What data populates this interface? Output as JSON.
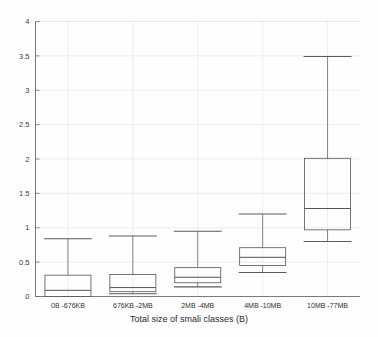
{
  "chart_data": {
    "type": "box",
    "title": "",
    "xlabel": "Total size of smali classes (B)",
    "ylabel": "",
    "categories": [
      "0B -676KB",
      "676KB -2MB",
      "2MB -4MB",
      "4MB -10MB",
      "10MB -77MB"
    ],
    "ylim": [
      0,
      4
    ],
    "ytick_labels": [
      "0",
      "0.5",
      "1",
      "1.5",
      "2",
      "2.5",
      "3",
      "3.5",
      "4"
    ],
    "ytick_values": [
      0,
      0.5,
      1,
      1.5,
      2,
      2.5,
      3,
      3.5,
      4
    ],
    "grid": true,
    "legend": "none",
    "boxes": [
      {
        "category": "0B -676KB",
        "whisker_low": 0.0,
        "q1": 0.0,
        "median": 0.09,
        "q3": 0.31,
        "whisker_high": 0.84
      },
      {
        "category": "676KB -2MB",
        "whisker_low": 0.04,
        "q1": 0.07,
        "median": 0.13,
        "q3": 0.32,
        "whisker_high": 0.88
      },
      {
        "category": "2MB -4MB",
        "whisker_low": 0.14,
        "q1": 0.2,
        "median": 0.28,
        "q3": 0.42,
        "whisker_high": 0.95
      },
      {
        "category": "4MB -10MB",
        "whisker_low": 0.35,
        "q1": 0.45,
        "median": 0.57,
        "q3": 0.71,
        "whisker_high": 1.2
      },
      {
        "category": "10MB -77MB",
        "whisker_low": 0.8,
        "q1": 0.97,
        "median": 1.28,
        "q3": 2.01,
        "whisker_high": 3.49
      }
    ],
    "colors": {
      "background": "#fefefe",
      "axis": "#6b6b6b",
      "grid": "#e3e3e6",
      "box_stroke": "#5d5d5d",
      "median": "#4a4a4a",
      "whisker": "#6a6a6a",
      "text": "#2e2e2e"
    }
  }
}
